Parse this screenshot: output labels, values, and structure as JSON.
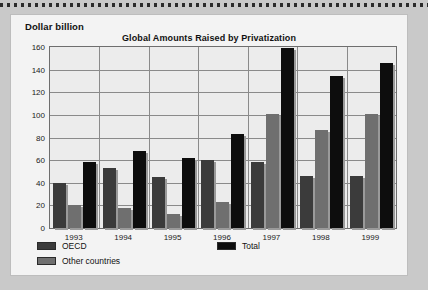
{
  "chart_data": {
    "type": "bar",
    "title": "Global Amounts Raised by Privatization",
    "unit_label": "Dollar billion",
    "xlabel": "",
    "ylabel": "Dollar billion",
    "ylim": [
      0,
      160
    ],
    "ytick_step": 20,
    "grid": true,
    "legend_position": "bottom-left",
    "categories": [
      "1993",
      "1994",
      "1995",
      "1996",
      "1997",
      "1998",
      "1999"
    ],
    "yticks": [
      "0",
      "20",
      "40",
      "60",
      "80",
      "100",
      "120",
      "140",
      "160"
    ],
    "series": [
      {
        "name": "OECD",
        "color": "#3b3b3b",
        "values": [
          40,
          53,
          45,
          60,
          58,
          46,
          46
        ]
      },
      {
        "name": "Other countries",
        "color": "#6f6f6f",
        "values": [
          20,
          18,
          12,
          23,
          101,
          87,
          101
        ]
      },
      {
        "name": "Total",
        "color": "#0d0d0d",
        "values": [
          58,
          68,
          62,
          83,
          159,
          134,
          146
        ]
      }
    ]
  },
  "legend": {
    "items": [
      {
        "label": "OECD"
      },
      {
        "label": "Other countries"
      },
      {
        "label": "Total"
      }
    ]
  },
  "colors": {
    "page_background": "#c9c9c9",
    "card_background": "#f3f3f3",
    "plot_background": "#ececec",
    "gridline": "#8a8a8a",
    "axis": "#6e6e6e",
    "text": "#111111"
  }
}
